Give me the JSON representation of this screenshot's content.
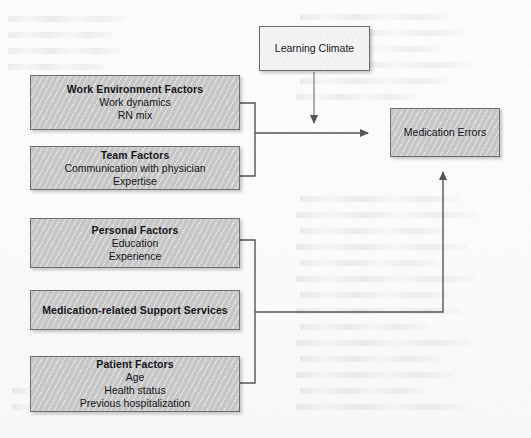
{
  "diagram": {
    "type": "conceptual-model-flow",
    "nodes": {
      "work_environment": {
        "title": "Work Environment Factors",
        "items": [
          "Work dynamics",
          "RN mix"
        ]
      },
      "team": {
        "title": "Team Factors",
        "items": [
          "Communication with physician",
          "Expertise"
        ]
      },
      "personal": {
        "title": "Personal Factors",
        "items": [
          "Education",
          "Experience"
        ]
      },
      "support_services": {
        "title": "Medication-related Support Services",
        "items": []
      },
      "patient": {
        "title": "Patient Factors",
        "items": [
          "Age",
          "Health status",
          "Previous hospitalization"
        ]
      },
      "learning_climate": {
        "title": "Learning Climate"
      },
      "outcome": {
        "title": "Medication Errors"
      }
    },
    "colors": {
      "shaded_fill": "#c6c6c6",
      "light_fill": "#f1f1f1",
      "border": "#6d6d6d",
      "connector": "#555555",
      "text": "#15151a",
      "page": "#fdfdfc"
    }
  }
}
